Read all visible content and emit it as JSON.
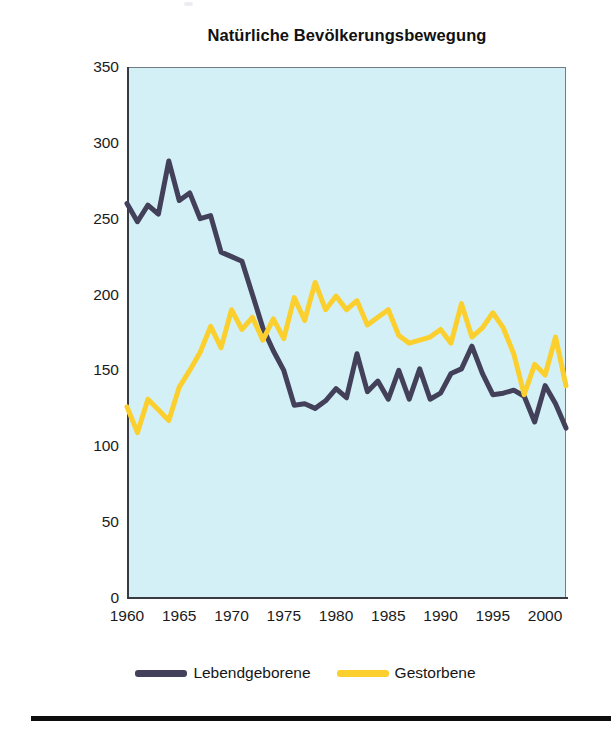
{
  "chart_data": {
    "type": "line",
    "title": "Natürliche Bevölkerungsbewegung",
    "xlabel": "",
    "ylabel": "",
    "xlim": [
      1960,
      2002
    ],
    "ylim": [
      0,
      350
    ],
    "grid": false,
    "legend_position": "bottom-center",
    "plot_background": "#d3f0f7",
    "x": [
      1960,
      1961,
      1962,
      1963,
      1964,
      1965,
      1966,
      1967,
      1968,
      1969,
      1970,
      1971,
      1972,
      1973,
      1974,
      1975,
      1976,
      1977,
      1978,
      1979,
      1980,
      1981,
      1982,
      1983,
      1984,
      1985,
      1986,
      1987,
      1988,
      1989,
      1990,
      1991,
      1992,
      1993,
      1994,
      1995,
      1996,
      1997,
      1998,
      1999,
      2000,
      2001,
      2002
    ],
    "series": [
      {
        "name": "Lebendgeborene",
        "color": "#43415a",
        "values": [
          260,
          248,
          259,
          253,
          288,
          262,
          267,
          250,
          252,
          228,
          225,
          222,
          200,
          178,
          163,
          150,
          127,
          128,
          125,
          130,
          138,
          132,
          161,
          136,
          143,
          131,
          150,
          131,
          151,
          131,
          135,
          148,
          151,
          166,
          148,
          134,
          135,
          137,
          133,
          116,
          140,
          128,
          112
        ]
      },
      {
        "name": "Gestorbene",
        "color": "#fbd02e",
        "values": [
          126,
          109,
          131,
          124,
          117,
          139,
          150,
          162,
          179,
          165,
          190,
          177,
          185,
          170,
          184,
          171,
          198,
          183,
          208,
          190,
          199,
          190,
          196,
          180,
          185,
          190,
          173,
          168,
          170,
          172,
          177,
          168,
          194,
          172,
          178,
          188,
          178,
          161,
          134,
          154,
          147,
          172,
          140
        ]
      }
    ]
  },
  "axes": {
    "y_ticks": [
      "350",
      "300",
      "250",
      "200",
      "150",
      "100",
      "50",
      "0"
    ],
    "y_tick_values": [
      350,
      300,
      250,
      200,
      150,
      100,
      50,
      0
    ],
    "x_ticks": [
      "1960",
      "1965",
      "1970",
      "1975",
      "1980",
      "1985",
      "1990",
      "1995",
      "2000"
    ],
    "x_tick_values": [
      1960,
      1965,
      1970,
      1975,
      1980,
      1985,
      1990,
      1995,
      2000
    ]
  },
  "legend": {
    "entries": [
      {
        "label": "Lebendgeborene",
        "color": "#43415a"
      },
      {
        "label": "Gestorbene",
        "color": "#fbd02e"
      }
    ]
  }
}
